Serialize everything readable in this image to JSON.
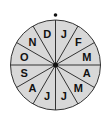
{
  "diagram": {
    "type": "month-wheel",
    "center": {
      "x": 55.5,
      "y": 65
    },
    "radius": 45,
    "fill_color": "#d8d8d8",
    "line_color": "#333333",
    "months": [
      "J",
      "F",
      "M",
      "A",
      "M",
      "J",
      "J",
      "A",
      "S",
      "O",
      "N",
      "D"
    ],
    "top_marker": "dot"
  }
}
